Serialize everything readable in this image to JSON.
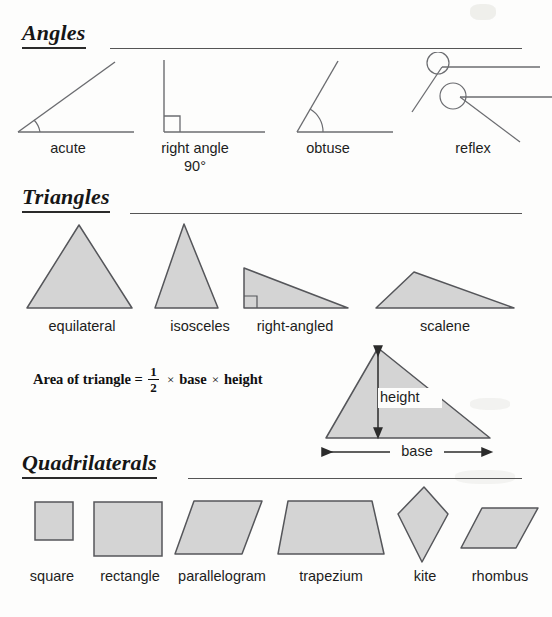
{
  "page": {
    "background": "#fdfdfc",
    "shape_fill": "#d4d4d4",
    "shape_stroke": "#55565a",
    "line_color": "#6b6c70",
    "text_color": "#1d1d1d"
  },
  "sections": [
    {
      "id": "angles",
      "heading": "Angles"
    },
    {
      "id": "triangles",
      "heading": "Triangles"
    },
    {
      "id": "quadrilaterals",
      "heading": "Quadrilaterals"
    }
  ],
  "angles": {
    "heading": "Angles",
    "items": [
      {
        "name": "acute",
        "label": "acute",
        "label2": ""
      },
      {
        "name": "right-angle",
        "label": "right angle",
        "label2": "90°"
      },
      {
        "name": "obtuse",
        "label": "obtuse",
        "label2": ""
      },
      {
        "name": "reflex",
        "label": "reflex",
        "label2": ""
      }
    ]
  },
  "triangles": {
    "heading": "Triangles",
    "items": [
      {
        "name": "equilateral",
        "label": "equilateral"
      },
      {
        "name": "isosceles",
        "label": "isosceles"
      },
      {
        "name": "right-angled",
        "label": "right-angled"
      },
      {
        "name": "scalene",
        "label": "scalene"
      }
    ],
    "formula": {
      "lead": "Area of triangle =",
      "numerator": "1",
      "denominator": "2",
      "times1": "×",
      "base_word": "base",
      "times2": "×",
      "height_word": "height"
    },
    "diagram": {
      "height_label": "height",
      "base_label": "base"
    }
  },
  "quadrilaterals": {
    "heading": "Quadrilaterals",
    "items": [
      {
        "name": "square",
        "label": "square"
      },
      {
        "name": "rectangle",
        "label": "rectangle"
      },
      {
        "name": "parallelogram",
        "label": "parallelogram"
      },
      {
        "name": "trapezium",
        "label": "trapezium"
      },
      {
        "name": "kite",
        "label": "kite"
      },
      {
        "name": "rhombus",
        "label": "rhombus"
      }
    ]
  }
}
